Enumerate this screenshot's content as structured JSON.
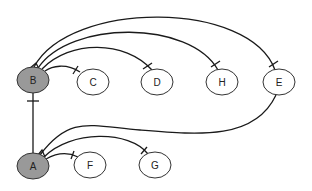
{
  "diagram": {
    "nodes": [
      {
        "id": "B",
        "label": "B",
        "cx": 33,
        "cy": 80,
        "rx": 16,
        "ry": 13,
        "fill": "#999999"
      },
      {
        "id": "C",
        "label": "C",
        "cx": 93,
        "cy": 82,
        "rx": 16,
        "ry": 13,
        "fill": "#ffffff"
      },
      {
        "id": "D",
        "label": "D",
        "cx": 157,
        "cy": 82,
        "rx": 16,
        "ry": 13,
        "fill": "#ffffff"
      },
      {
        "id": "H",
        "label": "H",
        "cx": 222,
        "cy": 82,
        "rx": 16,
        "ry": 13,
        "fill": "#ffffff"
      },
      {
        "id": "E",
        "label": "E",
        "cx": 279,
        "cy": 82,
        "rx": 16,
        "ry": 13,
        "fill": "#ffffff"
      },
      {
        "id": "A",
        "label": "A",
        "cx": 33,
        "cy": 166,
        "rx": 16,
        "ry": 13,
        "fill": "#999999"
      },
      {
        "id": "F",
        "label": "F",
        "cx": 90,
        "cy": 165,
        "rx": 16,
        "ry": 13,
        "fill": "#ffffff"
      },
      {
        "id": "G",
        "label": "G",
        "cx": 155,
        "cy": 165,
        "rx": 16,
        "ry": 13,
        "fill": "#ffffff"
      }
    ],
    "edges": [
      {
        "from": "B",
        "to": "C"
      },
      {
        "from": "B",
        "to": "D"
      },
      {
        "from": "B",
        "to": "H"
      },
      {
        "from": "B",
        "to": "E"
      },
      {
        "from": "A",
        "to": "B"
      },
      {
        "from": "E",
        "to": "A"
      },
      {
        "from": "A",
        "to": "F"
      },
      {
        "from": "A",
        "to": "G"
      }
    ]
  }
}
